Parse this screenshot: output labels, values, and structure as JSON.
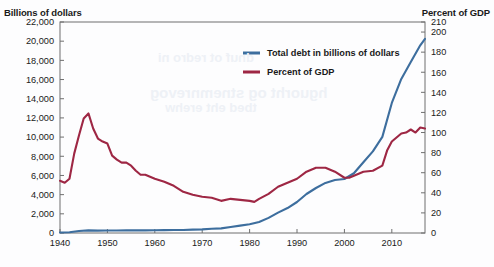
{
  "chart_data": {
    "type": "line",
    "title": "",
    "xlabel": "",
    "ylabel": "Billions of dollars",
    "y2label": "Percent of GDP",
    "grid": false,
    "legend_position": "top-center-right",
    "xlim": [
      1940,
      2017
    ],
    "ylim": [
      0,
      22000
    ],
    "y2lim": [
      0,
      210
    ],
    "xticks": [
      1940,
      1950,
      1960,
      1970,
      1980,
      1990,
      2000,
      2010
    ],
    "xtick_labels": [
      "1940",
      "1950",
      "1960",
      "1970",
      "1980",
      "1990",
      "2000",
      "2010"
    ],
    "yticks": [
      0,
      2000,
      4000,
      6000,
      8000,
      10000,
      12000,
      14000,
      16000,
      18000,
      20000,
      22000
    ],
    "ytick_labels": [
      "0",
      "2,000",
      "4,000",
      "6,000",
      "8,000",
      "10,000",
      "12,000",
      "14,000",
      "16,000",
      "18,000",
      "20,000",
      "22,000"
    ],
    "y2ticks": [
      0,
      20,
      40,
      60,
      80,
      100,
      120,
      140,
      160,
      180,
      200,
      210
    ],
    "y2tick_labels": [
      "0",
      "20",
      "40",
      "60",
      "80",
      "100",
      "120",
      "140",
      "160",
      "180",
      "200",
      "210"
    ],
    "series": [
      {
        "name": "Total debt in billions of dollars",
        "axis": "left",
        "color": "#3d6e9e",
        "x": [
          1940,
          1942,
          1944,
          1946,
          1948,
          1950,
          1952,
          1954,
          1956,
          1958,
          1960,
          1962,
          1964,
          1966,
          1968,
          1970,
          1972,
          1974,
          1976,
          1978,
          1980,
          1982,
          1984,
          1986,
          1988,
          1990,
          1992,
          1994,
          1996,
          1998,
          2000,
          2002,
          2004,
          2006,
          2008,
          2010,
          2012,
          2014,
          2016,
          2017
        ],
        "values": [
          51,
          79,
          204,
          271,
          252,
          257,
          259,
          271,
          272,
          276,
          286,
          298,
          312,
          320,
          348,
          381,
          436,
          484,
          629,
          772,
          909,
          1142,
          1577,
          2125,
          2602,
          3233,
          4065,
          4693,
          5225,
          5526,
          5629,
          6228,
          7379,
          8507,
          10025,
          13562,
          16066,
          17824,
          19573,
          20245
        ]
      },
      {
        "name": "Percent of GDP",
        "axis": "right",
        "color": "#9e2744",
        "x": [
          1940,
          1941,
          1942,
          1943,
          1944,
          1945,
          1946,
          1947,
          1948,
          1949,
          1950,
          1951,
          1952,
          1953,
          1954,
          1955,
          1956,
          1957,
          1958,
          1959,
          1960,
          1962,
          1964,
          1966,
          1968,
          1970,
          1972,
          1974,
          1976,
          1978,
          1980,
          1981,
          1982,
          1984,
          1986,
          1988,
          1990,
          1992,
          1994,
          1996,
          1998,
          2000,
          2001,
          2002,
          2004,
          2006,
          2008,
          2009,
          2010,
          2012,
          2013,
          2014,
          2015,
          2016,
          2017
        ],
        "values": [
          52,
          50,
          54,
          79,
          97,
          114,
          119,
          104,
          94,
          91,
          89,
          77,
          73,
          70,
          70,
          67,
          62,
          58,
          58,
          56,
          54,
          51,
          47,
          41,
          38,
          36,
          35,
          32,
          34,
          33,
          32,
          31,
          34,
          39,
          46,
          50,
          54,
          61,
          65,
          65,
          61,
          55,
          55,
          57,
          61,
          62,
          67,
          82,
          91,
          99,
          100,
          103,
          100,
          105,
          104
        ]
      }
    ]
  },
  "legend": {
    "entries": [
      {
        "label": "Total debt in billions of dollars",
        "color": "#3d6e9e"
      },
      {
        "label": "Percent of GDP",
        "color": "#9e2744"
      }
    ]
  },
  "labels": {
    "left_axis_title": "Billions of dollars",
    "right_axis_title": "Percent of GDP"
  },
  "background_bleed": {
    "line1": "hguorht og stnemnrevog",
    "line2": "tbed eht erehw",
    "line3": "dnuf ot redro ni"
  }
}
